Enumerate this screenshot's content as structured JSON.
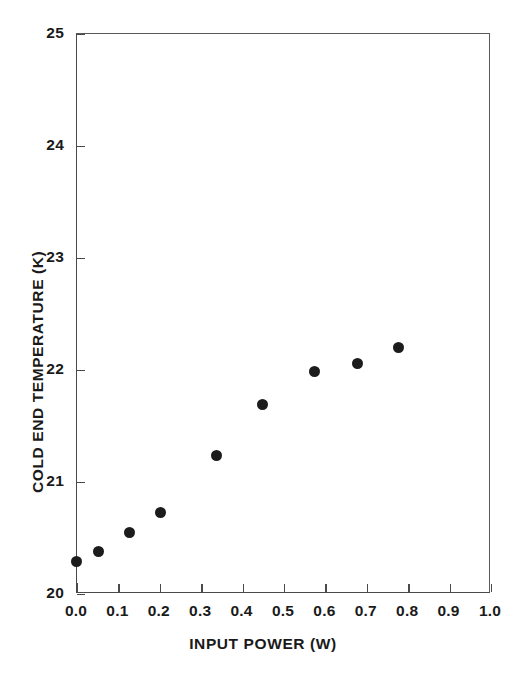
{
  "chart_data": {
    "type": "scatter",
    "title": "",
    "xlabel": "INPUT POWER (W)",
    "ylabel": "COLD END TEMPERATURE (K)",
    "xlim": [
      0.0,
      1.0
    ],
    "ylim": [
      20,
      25
    ],
    "xticks": [
      "0.0",
      "0.1",
      "0.2",
      "0.3",
      "0.4",
      "0.5",
      "0.6",
      "0.7",
      "0.8",
      "0.9",
      "1.0"
    ],
    "xtick_values": [
      0.0,
      0.1,
      0.2,
      0.3,
      0.4,
      0.5,
      0.6,
      0.7,
      0.8,
      0.9,
      1.0
    ],
    "yticks": [
      "20",
      "21",
      "22",
      "23",
      "24",
      "25"
    ],
    "ytick_values": [
      20,
      21,
      22,
      23,
      24,
      25
    ],
    "grid": false,
    "legend": false,
    "marker": "filled-circle",
    "marker_color": "#1c1c1c",
    "axis_color": "#4a4a4a",
    "background": "#ffffff",
    "x": [
      0.0,
      0.055,
      0.13,
      0.205,
      0.34,
      0.45,
      0.575,
      0.68,
      0.78
    ],
    "y": [
      20.28,
      20.37,
      20.54,
      20.72,
      21.23,
      21.68,
      21.98,
      22.05,
      22.19
    ],
    "points": [
      {
        "x": 0.0,
        "y": 20.28
      },
      {
        "x": 0.055,
        "y": 20.37
      },
      {
        "x": 0.13,
        "y": 20.54
      },
      {
        "x": 0.205,
        "y": 20.72
      },
      {
        "x": 0.34,
        "y": 21.23
      },
      {
        "x": 0.45,
        "y": 21.68
      },
      {
        "x": 0.575,
        "y": 21.98
      },
      {
        "x": 0.68,
        "y": 22.05
      },
      {
        "x": 0.78,
        "y": 22.19
      }
    ]
  }
}
